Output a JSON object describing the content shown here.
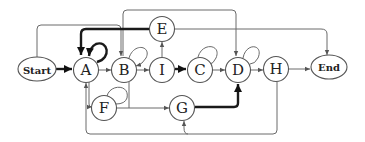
{
  "diagram": {
    "type": "flow-graph",
    "nodes": [
      {
        "id": "start",
        "label": "Start",
        "shape": "ellipse"
      },
      {
        "id": "A",
        "label": "A",
        "shape": "circle"
      },
      {
        "id": "B",
        "label": "B",
        "shape": "circle"
      },
      {
        "id": "I",
        "label": "I",
        "shape": "circle"
      },
      {
        "id": "C",
        "label": "C",
        "shape": "circle"
      },
      {
        "id": "D",
        "label": "D",
        "shape": "circle"
      },
      {
        "id": "H",
        "label": "H",
        "shape": "circle"
      },
      {
        "id": "end",
        "label": "End",
        "shape": "ellipse"
      },
      {
        "id": "E",
        "label": "E",
        "shape": "circle"
      },
      {
        "id": "F",
        "label": "F",
        "shape": "circle"
      },
      {
        "id": "G",
        "label": "G",
        "shape": "circle"
      }
    ],
    "edges": [
      {
        "from": "Start",
        "to": "A",
        "weight": "bold"
      },
      {
        "from": "A",
        "to": "A",
        "weight": "bold",
        "kind": "self-loop"
      },
      {
        "from": "E",
        "to": "A",
        "weight": "bold"
      },
      {
        "from": "Start",
        "to": "B",
        "weight": "thin"
      },
      {
        "from": "A",
        "to": "B",
        "weight": "thin"
      },
      {
        "from": "B",
        "to": "B",
        "weight": "thin",
        "kind": "self-loop"
      },
      {
        "from": "B",
        "to": "I",
        "weight": "thin"
      },
      {
        "from": "I",
        "to": "E",
        "weight": "thin"
      },
      {
        "from": "I",
        "to": "C",
        "weight": "bold"
      },
      {
        "from": "C",
        "to": "C",
        "weight": "thin",
        "kind": "self-loop"
      },
      {
        "from": "C",
        "to": "D",
        "weight": "thin"
      },
      {
        "from": "B",
        "to": "D",
        "weight": "thin"
      },
      {
        "from": "D",
        "to": "D",
        "weight": "thin",
        "kind": "self-loop"
      },
      {
        "from": "D",
        "to": "H",
        "weight": "thin"
      },
      {
        "from": "H",
        "to": "End",
        "weight": "thin"
      },
      {
        "from": "E",
        "to": "End",
        "weight": "thin"
      },
      {
        "from": "A",
        "to": "F",
        "weight": "thin"
      },
      {
        "from": "F",
        "to": "F",
        "weight": "thin",
        "kind": "self-loop"
      },
      {
        "from": "B",
        "to": "G",
        "weight": "thin"
      },
      {
        "from": "F",
        "to": "G",
        "weight": "thin"
      },
      {
        "from": "G",
        "to": "D",
        "weight": "bold"
      },
      {
        "from": "H",
        "to": "G",
        "weight": "thin"
      },
      {
        "from": "H",
        "to": "A",
        "weight": "thin"
      }
    ]
  }
}
